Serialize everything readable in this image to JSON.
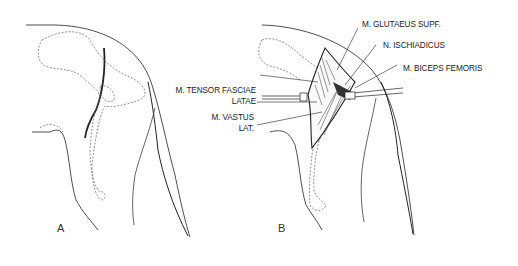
{
  "figure": {
    "panels": [
      {
        "id": "A",
        "label": "A",
        "description": "Lateral view of canine hip and thigh showing skin incision line"
      },
      {
        "id": "B",
        "label": "B",
        "description": "Surgical exposure with retractors showing underlying muscles and sciatic nerve"
      }
    ],
    "labels": {
      "glutaeus": "M. GLUTAEUS SUPF.",
      "ischiadicus": "N. ISCHIADICUS",
      "biceps": "M. BICEPS FEMORIS",
      "tensor_line1": "M. TENSOR FASCIAE",
      "tensor_line2": "LATAE",
      "vastus_line1": "M. VASTUS",
      "vastus_line2": "LAT."
    },
    "colors": {
      "line": "#222222",
      "dashed": "#777777",
      "background": "#ffffff"
    }
  }
}
